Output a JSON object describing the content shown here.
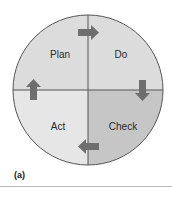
{
  "diagram": {
    "type": "cycle",
    "quadrants": [
      {
        "position": "top-left",
        "label": "Plan",
        "fill": "#dcdcdc"
      },
      {
        "position": "top-right",
        "label": "Do",
        "fill": "#dcdcdc"
      },
      {
        "position": "bottom-right",
        "label": "Check",
        "fill": "#c6c6c6"
      },
      {
        "position": "bottom-left",
        "label": "Act",
        "fill": "#e6e6e6"
      }
    ],
    "arrows": [
      {
        "name": "plan-to-do",
        "direction": "right"
      },
      {
        "name": "do-to-check",
        "direction": "down"
      },
      {
        "name": "check-to-act",
        "direction": "left"
      },
      {
        "name": "act-to-plan",
        "direction": "up"
      }
    ],
    "colors": {
      "outline": "#555555",
      "arrow": "#6e6e6e"
    }
  },
  "caption": "(a)"
}
